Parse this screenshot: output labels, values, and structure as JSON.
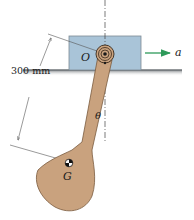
{
  "figure": {
    "labels": {
      "pivot": "O",
      "center_of_mass": "G",
      "angle": "θ",
      "acceleration": "a",
      "dimension": "300 mm"
    },
    "colors": {
      "block_fill": "#a9c4d8",
      "block_stroke": "#7d8a94",
      "link_fill": "#c9a27e",
      "link_stroke": "#7a5a3e",
      "ground": "#8a8e90",
      "arrow": "#2e9a5a",
      "dim_line": "#555555",
      "centerline": "#444444"
    }
  }
}
